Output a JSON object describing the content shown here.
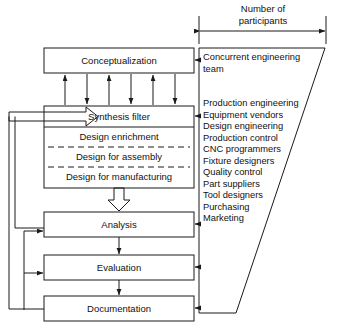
{
  "diagram": {
    "title_block": {
      "label": "Number of\nparticipants",
      "line1": "Number of",
      "line2": "participants",
      "dimension_icon": "double-headed-arrow-icon"
    },
    "process_boxes": [
      {
        "id": "conceptualization",
        "label": "Conceptualization"
      },
      {
        "id": "synthesis-filter",
        "label": "Synthesis filter"
      },
      {
        "id": "analysis",
        "label": "Analysis"
      },
      {
        "id": "evaluation",
        "label": "Evaluation"
      },
      {
        "id": "documentation",
        "label": "Documentation"
      }
    ],
    "synthesis_sub_rows": [
      {
        "id": "design-enrichment",
        "label": "Design enrichment"
      },
      {
        "id": "design-for-assembly",
        "label": "Design for assembly"
      },
      {
        "id": "design-for-manufacturing",
        "label": "Design for manufacturing"
      }
    ],
    "participants_panel": {
      "shape": "trapezoid",
      "groups": [
        {
          "id": "team-group",
          "items": [
            "Concurrent engineering",
            "team"
          ]
        },
        {
          "id": "roles-group",
          "items": [
            "Production engineering",
            "Equipment vendors",
            "Design engineering",
            "Production control",
            "CNC programmers",
            "Fixture designers",
            "Quality control",
            "Part suppliers",
            "Tool designers",
            "Purchasing",
            "Marketing"
          ]
        }
      ]
    },
    "connectors": {
      "exchange_arrows_count": 6,
      "exchange_pattern": [
        "up",
        "down",
        "up",
        "down",
        "up",
        "down"
      ],
      "block_arrow": "hollow-down-block-arrow-icon",
      "feed_arrow": "hollow-right-block-arrow-icon",
      "panel_arrows_count": 5,
      "feedback_loops": 4
    },
    "colors": {
      "line": "#1a1a1a",
      "text": "#111111",
      "background": "#ffffff"
    }
  }
}
